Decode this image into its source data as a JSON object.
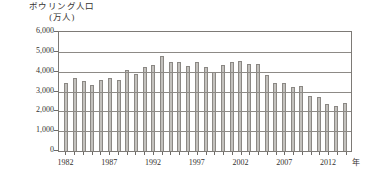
{
  "chart_data": {
    "type": "bar",
    "title": "ボウリング人口",
    "subtitle": "(万人)",
    "xlabel": "年",
    "ylabel": "万人",
    "ylim": [
      0,
      6000
    ],
    "ytick_step": 1000,
    "ytick_labels": [
      "6,000",
      "5,000",
      "4,000",
      "3,000",
      "2,000",
      "1,000",
      "0"
    ],
    "ytick_values": [
      6000,
      5000,
      4000,
      3000,
      2000,
      1000,
      0
    ],
    "grid": true,
    "legend": "none",
    "xtick_labels": [
      "1982",
      "1987",
      "1992",
      "1997",
      "2002",
      "2007",
      "2012"
    ],
    "xtick_values": [
      1982,
      1987,
      1992,
      1997,
      2002,
      2007,
      2012
    ],
    "categories": [
      "1982",
      "1983",
      "1984",
      "1985",
      "1986",
      "1987",
      "1988",
      "1989",
      "1990",
      "1991",
      "1992",
      "1993",
      "1994",
      "1995",
      "1996",
      "1997",
      "1998",
      "1999",
      "2000",
      "2001",
      "2002",
      "2003",
      "2004",
      "2005",
      "2006",
      "2007",
      "2008",
      "2009",
      "2010",
      "2011",
      "2012",
      "2013",
      "2014"
    ],
    "values": [
      3450,
      3700,
      3550,
      3350,
      3600,
      3700,
      3600,
      4100,
      3900,
      4250,
      4350,
      4800,
      4500,
      4500,
      4300,
      4500,
      4250,
      4000,
      4350,
      4500,
      4550,
      4400,
      4400,
      3850,
      3450,
      3450,
      3250,
      3300,
      2750,
      2700,
      2350,
      2250,
      2400
    ],
    "bar_color": "#c3c1bd",
    "bar_edge_color": "#8b8884",
    "axis_color": "#7d7a76"
  }
}
